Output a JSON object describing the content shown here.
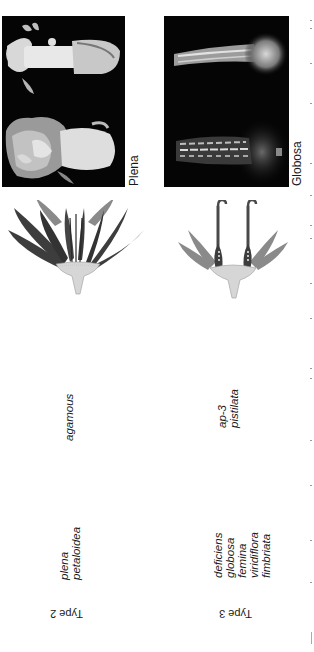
{
  "figure": {
    "orientation": "rotated 90 degrees counter-clockwise",
    "columns": [
      {
        "id": "type2",
        "type_label": "Type 2",
        "mutants_antirrhinum": [
          "plena",
          "petaloidea"
        ],
        "mutants_arabidopsis": [
          "agamous"
        ],
        "photo_label": "Plena"
      },
      {
        "id": "type3",
        "type_label": "Type 3",
        "mutants_antirrhinum": [
          "deficiens",
          "globosa",
          "femina",
          "viridiflora",
          "fimbriata"
        ],
        "mutants_arabidopsis": [
          "ap-3",
          "pistilata"
        ],
        "photo_label": "Globosa"
      }
    ]
  },
  "colors": {
    "photo_bg": "#050505",
    "petal_dark": "#3d3d3d",
    "sepal_gray": "#8a8a8a",
    "receptacle": "#d6d6d6",
    "text": "#1a1a1a"
  }
}
